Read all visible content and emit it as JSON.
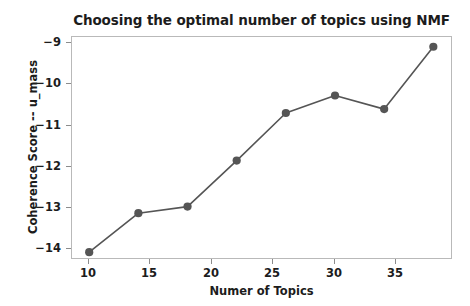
{
  "chart_data": {
    "type": "line",
    "title": "Choosing the optimal number of topics using NMF",
    "xlabel": "Numer of Topics",
    "ylabel": "Coherence Score -- u_mass",
    "x": [
      10,
      14,
      18,
      22,
      26,
      30,
      34,
      38
    ],
    "values": [
      -14.35,
      -13.35,
      -13.18,
      -12.0,
      -10.78,
      -10.33,
      -10.68,
      -9.08
    ],
    "series": [
      {
        "name": "u_mass coherence",
        "values": [
          -14.35,
          -13.35,
          -13.18,
          -12.0,
          -10.78,
          -10.33,
          -10.68,
          -9.08
        ]
      }
    ],
    "xlim": [
      8.6,
      39.6
    ],
    "ylim": [
      -14.55,
      -8.83
    ],
    "xticks": [
      10,
      15,
      20,
      25,
      30,
      35
    ],
    "xtick_labels": [
      "10",
      "15",
      "20",
      "25",
      "30",
      "35"
    ],
    "yticks": [
      -9,
      -10,
      -11,
      -12,
      -13,
      -14
    ],
    "ytick_labels": [
      "−9",
      "−10",
      "−11",
      "−12",
      "−13",
      "−14"
    ],
    "grid": false,
    "legend": null,
    "legend_position": "none",
    "marker": "circle",
    "line_color": "#555555",
    "marker_color": "#555555",
    "background_color": "#ffffff",
    "frame_color": "#b9b9b9"
  }
}
